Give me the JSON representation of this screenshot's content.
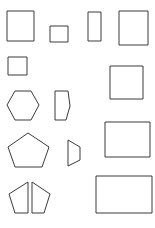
{
  "page": {
    "background_color": "#ffffff",
    "stroke_color": "#3a3a3a",
    "fill_color": "#ffffff",
    "stroke_width": 1,
    "width": 155,
    "height": 228
  },
  "shapes": [
    {
      "id": "square-large-top-left",
      "name": "square",
      "label": "Square",
      "row": 1,
      "column": 1,
      "points": "7,11 34,11 34,41 7,41",
      "bbox": {
        "x": 7,
        "y": 11,
        "width": 27,
        "height": 30
      },
      "sides": 4
    },
    {
      "id": "square-small-top",
      "name": "square",
      "label": "Small Square",
      "row": 1,
      "column": 2,
      "points": "50,26 68,26 68,42 50,42",
      "bbox": {
        "x": 50,
        "y": 26,
        "width": 18,
        "height": 16
      },
      "sides": 4
    },
    {
      "id": "rectangle-narrow-tall-top",
      "name": "rectangle",
      "label": "Narrow Tall Rectangle",
      "row": 1,
      "column": 3,
      "points": "88,12 101,12 101,41 88,41",
      "bbox": {
        "x": 88,
        "y": 12,
        "width": 13,
        "height": 29
      },
      "sides": 4
    },
    {
      "id": "rectangle-portrait-top-right",
      "name": "rectangle",
      "label": "Portrait Rectangle",
      "row": 1,
      "column": 4,
      "points": "119,11 148,11 148,45 119,45",
      "bbox": {
        "x": 119,
        "y": 11,
        "width": 29,
        "height": 34
      },
      "sides": 4
    },
    {
      "id": "square-small-second-row",
      "name": "square",
      "label": "Small Square",
      "row": 2,
      "column": 1,
      "points": "8,57 27,57 27,75 8,75",
      "bbox": {
        "x": 8,
        "y": 57,
        "width": 19,
        "height": 18
      },
      "sides": 4
    },
    {
      "id": "square-large-second-row-right",
      "name": "square",
      "label": "Square",
      "row": 2,
      "column": 4,
      "points": "110,66 143,66 143,99 110,99",
      "bbox": {
        "x": 110,
        "y": 66,
        "width": 33,
        "height": 33
      },
      "sides": 4
    },
    {
      "id": "hexagon-regular",
      "name": "hexagon",
      "label": "Hexagon",
      "row": 3,
      "column": 1,
      "points": "15,91 31,91 39,105 31,120 15,120 7,105",
      "bbox": {
        "x": 7,
        "y": 91,
        "width": 32,
        "height": 29
      },
      "sides": 6
    },
    {
      "id": "pentagon-right-pointing-narrow",
      "name": "pentagon",
      "label": "Narrow Right-Pointing Pentagon",
      "row": 3,
      "column": 2,
      "points": "55,91 68,91 70,106 66,120 55,120",
      "bbox": {
        "x": 55,
        "y": 91,
        "width": 15,
        "height": 29
      },
      "sides": 5
    },
    {
      "id": "rectangle-landscape-middle-right",
      "name": "rectangle",
      "label": "Landscape Rectangle",
      "row": 4,
      "column": 4,
      "points": "105,122 150,122 150,157 105,157",
      "bbox": {
        "x": 105,
        "y": 122,
        "width": 45,
        "height": 35
      },
      "sides": 4
    },
    {
      "id": "pentagon-regular",
      "name": "pentagon",
      "label": "Pentagon",
      "row": 4,
      "column": 1,
      "points": "28,133 49,147 42,167 15,167 8,147",
      "bbox": {
        "x": 8,
        "y": 133,
        "width": 41,
        "height": 34
      },
      "sides": 5
    },
    {
      "id": "trapezoid-right-pointing",
      "name": "trapezoid",
      "label": "Right-Pointing Trapezoid",
      "row": 4,
      "column": 2,
      "points": "68,140 80,147 80,160 68,166",
      "bbox": {
        "x": 68,
        "y": 140,
        "width": 12,
        "height": 26
      },
      "sides": 4
    },
    {
      "id": "pentagon-split-left-half",
      "name": "pentagon-half",
      "label": "Split Pentagon Left Half",
      "row": 5,
      "column": 1,
      "points": "28,182 28,213 15,213 9,194",
      "bbox": {
        "x": 9,
        "y": 182,
        "width": 19,
        "height": 31
      },
      "sides": 4
    },
    {
      "id": "pentagon-split-right-half",
      "name": "pentagon-half",
      "label": "Split Pentagon Right Half",
      "row": 5,
      "column": 2,
      "points": "32,182 50,194 44,213 32,213",
      "bbox": {
        "x": 32,
        "y": 182,
        "width": 18,
        "height": 31
      },
      "sides": 4
    },
    {
      "id": "rectangle-landscape-bottom-right",
      "name": "rectangle",
      "label": "Landscape Rectangle",
      "row": 5,
      "column": 4,
      "points": "96,176 152,176 152,213 96,213",
      "bbox": {
        "x": 96,
        "y": 176,
        "width": 56,
        "height": 37
      },
      "sides": 4
    }
  ]
}
